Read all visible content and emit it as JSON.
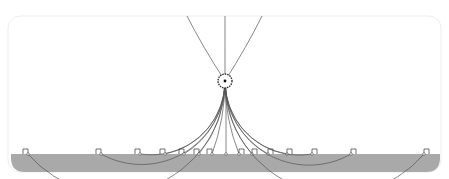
{
  "diagram": {
    "charge": {
      "cx": 225,
      "cy": 81,
      "r": 7
    },
    "plane": {
      "y": 154,
      "x1": 11,
      "x2": 440,
      "color": "#a9a9a9",
      "line_color": "#444444"
    },
    "frame": {
      "x": 8,
      "y": 16,
      "w": 433,
      "h": 156,
      "rx": 12,
      "color": "#eeeeee"
    },
    "line_color": "#555555",
    "foot_points_x": [
      28,
      101,
      140,
      165,
      184,
      199,
      212,
      239,
      252,
      268,
      287,
      312,
      351,
      424
    ],
    "vertical_line_x": 226,
    "escaping_lines": [
      {
        "x_top": 187,
        "label": "upper-left"
      },
      {
        "x_top": 225,
        "label": "upper-center"
      },
      {
        "x_top": 262,
        "label": "upper-right"
      }
    ],
    "right_angle_markers": true
  }
}
